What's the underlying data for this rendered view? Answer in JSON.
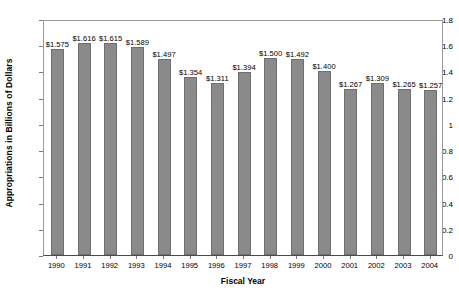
{
  "chart_data": {
    "type": "bar",
    "title": "",
    "xlabel": "Fiscal Year",
    "ylabel": "Appropriations in Billions of Dollars",
    "categories": [
      "1990",
      "1991",
      "1992",
      "1993",
      "1994",
      "1995",
      "1996",
      "1997",
      "1998",
      "1999",
      "2000",
      "2001",
      "2002",
      "2003",
      "2004"
    ],
    "values": [
      1.575,
      1.616,
      1.615,
      1.589,
      1.497,
      1.354,
      1.311,
      1.394,
      1.5,
      1.492,
      1.4,
      1.267,
      1.309,
      1.265,
      1.257
    ],
    "data_labels": [
      "$1.575",
      "$1.616",
      "$1.615",
      "$1.589",
      "$1.497",
      "$1.354",
      "$1.311",
      "$1.394",
      "$1.500",
      "$1.492",
      "$1.400",
      "$1.267",
      "$1.309",
      "$1.265",
      "$1.257"
    ],
    "ylim": [
      0,
      1.8
    ],
    "yticks": [
      0,
      0.2,
      0.4,
      0.6,
      0.8,
      1.0,
      1.2,
      1.4,
      1.6,
      1.8
    ],
    "ytick_labels": [
      "0",
      "0.2",
      "0.4",
      "0.6",
      "0.8",
      "1",
      "1.2",
      "1.4",
      "1.6",
      "1.8"
    ],
    "grid": false,
    "legend": null,
    "bar_color": "#8a8a8a",
    "bar_edge_color": "#6f6f6f",
    "background_color": "#ffffff",
    "axis_color": "#9a9a9a"
  }
}
